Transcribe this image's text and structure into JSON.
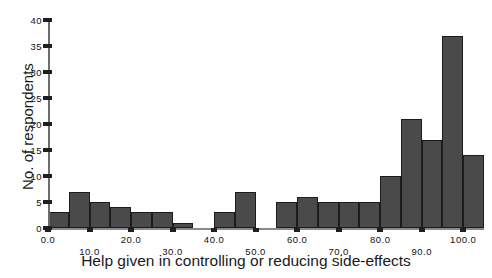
{
  "chart_data": {
    "type": "bar",
    "title": "",
    "xlabel": "Help given in controlling or reducing side-effects",
    "ylabel": "No. of respondents",
    "xlim": [
      0,
      105
    ],
    "ylim": [
      0,
      40
    ],
    "grid": false,
    "legend": null,
    "bin_width": 5,
    "xticks": [
      0,
      10,
      20,
      30,
      40,
      50,
      60,
      70,
      80,
      90,
      100
    ],
    "xticklabels": [
      "0.0",
      "10.0",
      "20.0",
      "30.0",
      "40.0",
      "50.0",
      "60.0",
      "70.0",
      "80.0",
      "90.0",
      "100.0"
    ],
    "yticks": [
      0,
      5,
      10,
      15,
      20,
      25,
      30,
      35,
      40
    ],
    "yticklabels": [
      "0",
      "5",
      "10",
      "15",
      "20",
      "25",
      "30",
      "35",
      "40"
    ],
    "bar_color": "#4a4a4a",
    "bar_edge_color": "#1c1c1c",
    "bins": [
      {
        "x0": 0,
        "x1": 5,
        "value": 3
      },
      {
        "x0": 5,
        "x1": 10,
        "value": 7
      },
      {
        "x0": 10,
        "x1": 15,
        "value": 5
      },
      {
        "x0": 15,
        "x1": 20,
        "value": 4
      },
      {
        "x0": 20,
        "x1": 25,
        "value": 3
      },
      {
        "x0": 25,
        "x1": 30,
        "value": 3
      },
      {
        "x0": 30,
        "x1": 35,
        "value": 1
      },
      {
        "x0": 35,
        "x1": 40,
        "value": 0
      },
      {
        "x0": 40,
        "x1": 45,
        "value": 3
      },
      {
        "x0": 45,
        "x1": 50,
        "value": 7
      },
      {
        "x0": 50,
        "x1": 55,
        "value": 0
      },
      {
        "x0": 55,
        "x1": 60,
        "value": 5
      },
      {
        "x0": 60,
        "x1": 65,
        "value": 6
      },
      {
        "x0": 65,
        "x1": 70,
        "value": 5
      },
      {
        "x0": 70,
        "x1": 75,
        "value": 5
      },
      {
        "x0": 75,
        "x1": 80,
        "value": 5
      },
      {
        "x0": 80,
        "x1": 85,
        "value": 10
      },
      {
        "x0": 85,
        "x1": 90,
        "value": 21
      },
      {
        "x0": 90,
        "x1": 95,
        "value": 17
      },
      {
        "x0": 95,
        "x1": 100,
        "value": 37
      },
      {
        "x0": 100,
        "x1": 105,
        "value": 14
      }
    ]
  }
}
